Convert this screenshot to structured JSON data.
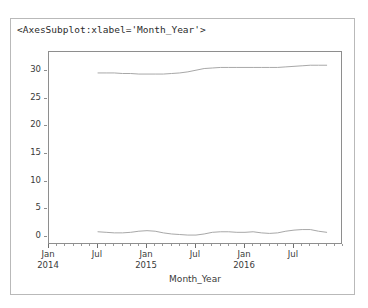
{
  "repr": {
    "text": "<AxesSubplot:xlabel='Month_Year'>"
  },
  "colors": {
    "outer_border": "#b9b9b9",
    "axes_spine": "#8e8e8e",
    "line": "#a8a8a8",
    "tick_text": "#3a3a3a",
    "background": "#ffffff"
  },
  "chart_data": {
    "type": "line",
    "title": "",
    "xlabel": "Month_Year",
    "ylabel": "",
    "ylim": [
      -1.5,
      33.5
    ],
    "yticks": [
      0,
      5,
      10,
      15,
      20,
      25,
      30
    ],
    "ytick_labels": [
      "0",
      "5",
      "10",
      "15",
      "20",
      "25",
      "30"
    ],
    "grid": false,
    "legend": "none",
    "xlim": [
      "2014-01",
      "2017-01"
    ],
    "xticks": [
      "2014-01",
      "2014-07",
      "2015-01",
      "2015-07",
      "2016-01",
      "2016-07"
    ],
    "xtick_labels": [
      "Jan\n2014",
      "Jul",
      "Jan\n2015",
      "Jul",
      "Jan\n2016",
      "Jul"
    ],
    "x_minor_tick_interval_months": 1,
    "x": [
      "2014-07",
      "2014-08",
      "2014-09",
      "2014-10",
      "2014-11",
      "2014-12",
      "2015-01",
      "2015-02",
      "2015-03",
      "2015-04",
      "2015-05",
      "2015-06",
      "2015-07",
      "2015-08",
      "2015-09",
      "2015-10",
      "2015-11",
      "2015-12",
      "2016-01",
      "2016-02",
      "2016-03",
      "2016-04",
      "2016-05",
      "2016-06",
      "2016-07",
      "2016-08",
      "2016-09",
      "2016-10",
      "2016-11"
    ],
    "series": [
      {
        "name": "upper",
        "values": [
          29.7,
          29.7,
          29.7,
          29.6,
          29.6,
          29.5,
          29.5,
          29.5,
          29.5,
          29.6,
          29.7,
          29.9,
          30.2,
          30.5,
          30.6,
          30.7,
          30.7,
          30.7,
          30.7,
          30.7,
          30.7,
          30.7,
          30.7,
          30.8,
          30.9,
          31.0,
          31.1,
          31.1,
          31.1
        ]
      },
      {
        "name": "lower",
        "values": [
          0.9,
          0.8,
          0.7,
          0.7,
          0.8,
          1.0,
          1.1,
          1.0,
          0.7,
          0.5,
          0.4,
          0.3,
          0.3,
          0.5,
          0.8,
          0.9,
          0.9,
          0.8,
          0.8,
          0.9,
          0.7,
          0.6,
          0.7,
          1.0,
          1.2,
          1.3,
          1.3,
          1.0,
          0.8
        ]
      }
    ]
  }
}
